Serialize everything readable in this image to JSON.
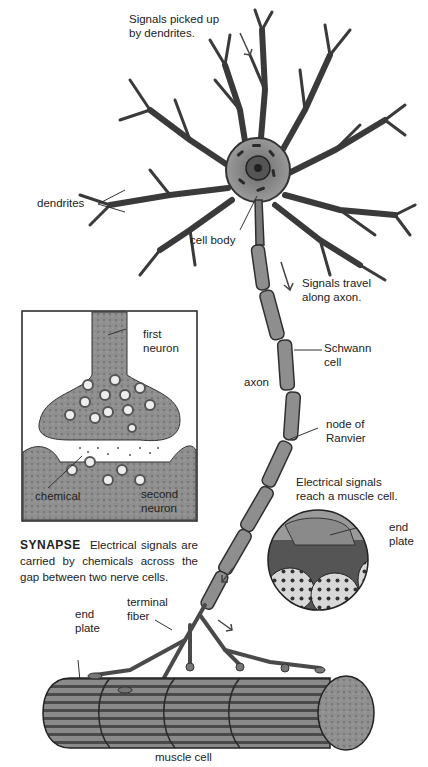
{
  "diagram": {
    "type": "labeled illustration",
    "colors": {
      "ink": "#222222",
      "cell_fill": "#8c8c8c",
      "cell_light": "#b0b0b0",
      "background": "#ffffff"
    }
  },
  "labels": {
    "signals_dendrites": [
      "Signals picked up",
      "by dendrites."
    ],
    "dendrites": "dendrites",
    "cell_body": "cell body",
    "signals_axon": [
      "Signals travel",
      "along axon."
    ],
    "schwann": [
      "Schwann",
      "cell"
    ],
    "axon": "axon",
    "node": [
      "node of",
      "Ranvier"
    ],
    "muscle_signal": [
      "Electrical signals",
      "reach a muscle cell."
    ],
    "end_plate_inset": [
      "end",
      "plate"
    ],
    "end_plate": [
      "end",
      "plate"
    ],
    "terminal_fiber": [
      "terminal",
      "fiber"
    ],
    "muscle_cell": "muscle cell"
  },
  "synapse_inset": {
    "first_neuron": [
      "first",
      "neuron"
    ],
    "chemical": "chemical",
    "second_neuron": [
      "second",
      "neuron"
    ],
    "caption_title": "SYNAPSE",
    "caption_text": "Electrical signals are carried by chemicals across the gap between two nerve cells."
  }
}
